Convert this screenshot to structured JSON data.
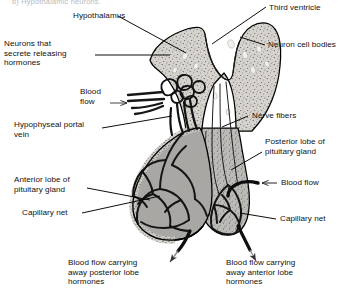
{
  "figure": {
    "title_fragment": "b) Hypothalamic neurons."
  },
  "labels": {
    "hypothalamus": "Hypothalamus",
    "third_ventricle": "Third ventricle",
    "neuron_cell_bodies": "Neuron cell bodies",
    "neurons_secreting": "Neurons that\nsecrete releasing\nhormones",
    "blood_flow_in": "Blood\nflow",
    "hypophyseal_portal_vein": "Hypophyseal portal\nvein",
    "nerve_fibers": "Nerve fibers",
    "posterior_lobe": "Posterior lobe of\npituitary gland",
    "blood_flow_posterior": "Blood flow",
    "anterior_lobe": "Anterior lobe of\npituitary gland",
    "capillary_net_left": "Capillary net",
    "capillary_net_right": "Capillary net",
    "outflow_posterior": "Blood flow carrying\naway posterior lobe\nhormones",
    "outflow_anterior": "Blood flow carrying\naway anterior lobe\nhormones"
  },
  "colors": {
    "background": "#ffffff",
    "line": "#000000",
    "hypothalamus_fill": "#d6d3ce",
    "anterior_lobe_fill": "#a9a7a4",
    "posterior_lobe_fill": "#bcbab6",
    "vessel_dark": "#1a1a1a",
    "stipple": "#4a4a4a",
    "text": "#111111"
  }
}
